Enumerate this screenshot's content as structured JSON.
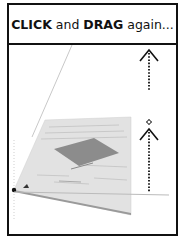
{
  "header": {
    "word_click": "CLICK",
    "word_and": " and ",
    "word_drag": "DRAG",
    "word_again": " again..."
  },
  "scene": {
    "description": "perspective tilted document page with drag-up arrows",
    "icons": [
      "up-arrow-icon",
      "move-cursor-icon",
      "up-arrow-icon",
      "anchor-point-icon"
    ]
  },
  "colors": {
    "border": "#111111",
    "page": "#e4e4e4",
    "page_rect": "#8a8a8a",
    "arrow": "#111111"
  }
}
